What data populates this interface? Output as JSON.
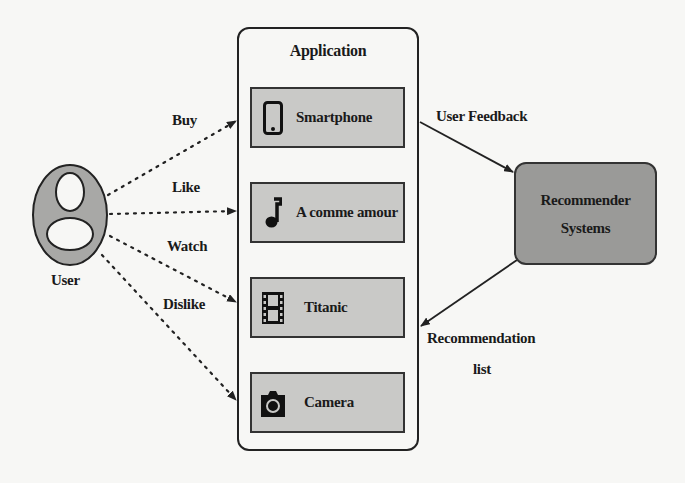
{
  "user": {
    "label": "User"
  },
  "actions": [
    {
      "label": "Buy"
    },
    {
      "label": "Like"
    },
    {
      "label": "Watch"
    },
    {
      "label": "Dislike"
    }
  ],
  "application": {
    "title": "Application",
    "items": [
      {
        "label": "Smartphone",
        "icon": "smartphone-icon"
      },
      {
        "label": "A comme amour",
        "icon": "music-note-icon"
      },
      {
        "label": "Titanic",
        "icon": "film-strip-icon"
      },
      {
        "label": "Camera",
        "icon": "camera-icon"
      }
    ]
  },
  "recommender": {
    "line1": "Recommender",
    "line2": "Systems"
  },
  "flows": {
    "feedback": "User Feedback",
    "recommendation_line1": "Recommendation",
    "recommendation_line2": "list"
  },
  "colors": {
    "item_fill": "#c9c9c7",
    "recommender_fill": "#9a9a98",
    "user_fill": "#a8a8a6",
    "stroke": "#222222",
    "background": "#f7f7f5"
  }
}
